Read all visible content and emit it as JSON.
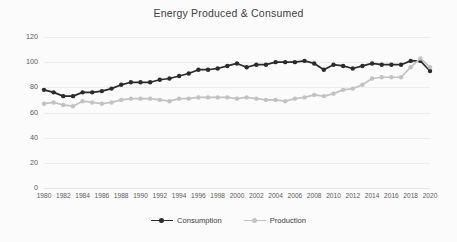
{
  "chart_data": {
    "type": "line",
    "title": "Energy Produced & Consumed",
    "xlabel": "",
    "ylabel": "",
    "ylim": [
      0,
      120
    ],
    "yticks": [
      0,
      20,
      40,
      60,
      80,
      100,
      120
    ],
    "xlim": [
      1980,
      2020
    ],
    "xticks": [
      1980,
      1982,
      1984,
      1986,
      1988,
      1990,
      1992,
      1994,
      1996,
      1998,
      2000,
      2002,
      2004,
      2006,
      2008,
      2010,
      2012,
      2014,
      2016,
      2018,
      2020
    ],
    "grid": true,
    "legend_position": "bottom",
    "x": [
      1980,
      1981,
      1982,
      1983,
      1984,
      1985,
      1986,
      1987,
      1988,
      1989,
      1990,
      1991,
      1992,
      1993,
      1994,
      1995,
      1996,
      1997,
      1998,
      1999,
      2000,
      2001,
      2002,
      2003,
      2004,
      2005,
      2006,
      2007,
      2008,
      2009,
      2010,
      2011,
      2012,
      2013,
      2014,
      2015,
      2016,
      2017,
      2018,
      2019,
      2020
    ],
    "series": [
      {
        "name": "Consumption",
        "color": "#2b2b2b",
        "values": [
          78,
          76,
          73,
          73,
          76,
          76,
          77,
          79,
          82,
          84,
          84,
          84,
          86,
          87,
          89,
          91,
          94,
          94,
          95,
          97,
          99,
          96,
          98,
          98,
          100,
          100,
          100,
          101,
          99,
          94,
          98,
          97,
          95,
          97,
          99,
          98,
          98,
          98,
          101,
          101,
          93
        ]
      },
      {
        "name": "Production",
        "color": "#c2c2c2",
        "values": [
          67,
          68,
          66,
          65,
          69,
          68,
          67,
          68,
          70,
          71,
          71,
          71,
          70,
          69,
          71,
          71,
          72,
          72,
          72,
          72,
          71,
          72,
          71,
          70,
          70,
          69,
          71,
          72,
          74,
          73,
          75,
          78,
          79,
          82,
          87,
          88,
          88,
          88,
          96,
          103,
          96
        ]
      }
    ]
  },
  "legend": {
    "items": [
      {
        "label": "Consumption"
      },
      {
        "label": "Production"
      }
    ]
  }
}
